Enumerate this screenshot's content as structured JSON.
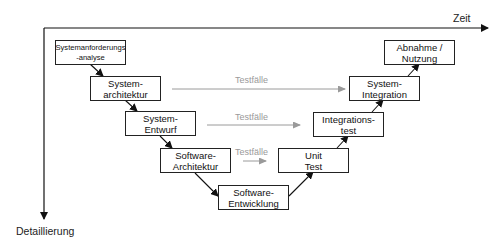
{
  "axes": {
    "x_label": "Zeit",
    "y_label": "Detaillierung"
  },
  "left_branch": [
    {
      "line1": "Systemanforderungs",
      "line2": "-analyse"
    },
    {
      "line1": "System-",
      "line2": "architektur"
    },
    {
      "line1": "System-",
      "line2": "Entwurf"
    },
    {
      "line1": "Software-",
      "line2": "Architektur"
    }
  ],
  "bottom": {
    "line1": "Software-",
    "line2": "Entwicklung"
  },
  "right_branch": [
    {
      "line1": "Unit",
      "line2": "Test"
    },
    {
      "line1": "Integrations-",
      "line2": "test"
    },
    {
      "line1": "System-",
      "line2": "Integration"
    },
    {
      "line1": "Abnahme /",
      "line2": "Nutzung"
    }
  ],
  "test_links": [
    {
      "label": "Testfälle"
    },
    {
      "label": "Testfälle"
    },
    {
      "label": "Testfälle"
    }
  ],
  "colors": {
    "line": "#111111",
    "testcase": "#9a9a9a"
  }
}
